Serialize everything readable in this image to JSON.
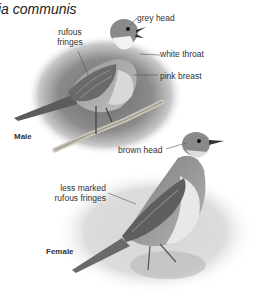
{
  "plate": {
    "title": "ia communis",
    "male": {
      "sex_label": "Male",
      "annotations": [
        {
          "id": "grey-head",
          "text": "grey head"
        },
        {
          "id": "rufous-fringes",
          "line1": "rufous",
          "line2": "fringes"
        },
        {
          "id": "white-throat",
          "text": "white throat"
        },
        {
          "id": "pink-breast",
          "text": "pink breast"
        }
      ]
    },
    "female": {
      "sex_label": "Female",
      "annotations": [
        {
          "id": "brown-head",
          "text": "brown head"
        },
        {
          "id": "less-marked-rufous-fringes",
          "line1": "less marked",
          "line2": "rufous fringes"
        }
      ]
    }
  }
}
